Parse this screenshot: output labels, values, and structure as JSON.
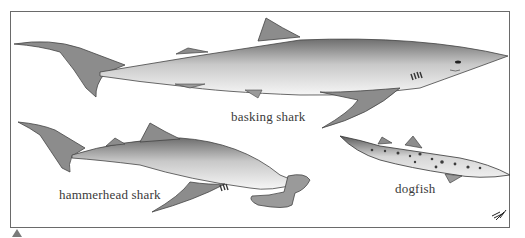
{
  "illustration": {
    "labels": {
      "basking": "basking shark",
      "hammerhead": "hammerhead shark",
      "dogfish": "dogfish"
    },
    "colors": {
      "frame": "#6a6a6a",
      "fin": "#8c8c8c",
      "body_dark": "#7d7d7d",
      "body_light": "#f2f2f2",
      "dogfish_spots": "#3c3c3c"
    }
  },
  "marker": {
    "icon": "triangle-up"
  }
}
